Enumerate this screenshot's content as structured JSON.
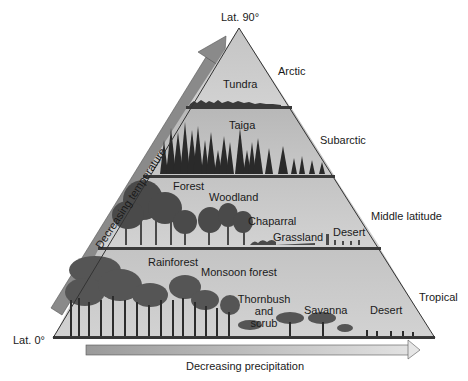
{
  "diagram": {
    "apex_label": "Lat. 90°",
    "base_label": "Lat. 0°",
    "temperature_axis": "Decreasing temperature",
    "precipitation_axis": "Decreasing precipitation",
    "zones": [
      {
        "name": "Arctic",
        "biomes": [
          "Tundra"
        ]
      },
      {
        "name": "Subarctic",
        "biomes": [
          "Taiga"
        ]
      },
      {
        "name": "Middle latitude",
        "biomes": [
          "Forest",
          "Woodland",
          "Chaparral",
          "Grassland",
          "Desert"
        ]
      },
      {
        "name": "Tropical",
        "biomes": [
          "Rainforest",
          "Monsoon forest",
          "Thornbush and scrub",
          "Savanna",
          "Desert"
        ]
      }
    ],
    "thornbush_lines": [
      "Thornbush",
      "and",
      "scrub"
    ],
    "colors": {
      "band_fill": "#c8c8c8",
      "band_fill_dark": "#b4b4b4",
      "divider": "#3a3a3a",
      "arrow_fill": "#8a8a8a",
      "arrow_fill_light": "#d8d8d8",
      "vegetation": "#2e2e2e"
    }
  }
}
